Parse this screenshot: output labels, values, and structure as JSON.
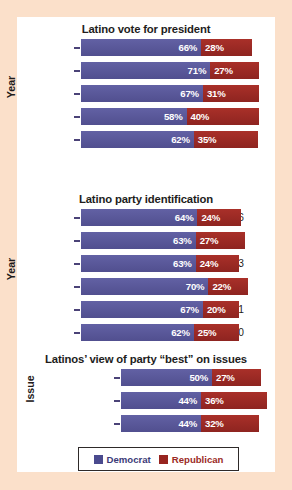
{
  "colors": {
    "outer_background": "#fbe0ca",
    "panel_background": "#ffffff",
    "democrat": "#59589a",
    "republican": "#9f2b25",
    "title_text": "#221d1c",
    "label_text": "#1f1b1a",
    "tick": "#4a4277",
    "legend_border": "#2e2a29",
    "legend_democrat_text": "#3c3a78",
    "legend_republican_text": "#9b2a24"
  },
  "legend": {
    "democrat_label": "Democrat",
    "republican_label": "Republican",
    "democrat_swatch": "democrat-color-swatch",
    "republican_swatch": "republican-color-swatch"
  },
  "chart_data": [
    {
      "type": "bar",
      "orientation": "horizontal",
      "stacked": true,
      "title": "Latino vote for president",
      "xlabel": "",
      "ylabel": "Year",
      "categories": [
        "2016",
        "2012",
        "2008",
        "2004",
        "2000"
      ],
      "series": [
        {
          "name": "Democrat",
          "values": [
            66,
            71,
            67,
            58,
            62
          ],
          "labels": [
            "66%",
            "71%",
            "67%",
            "58%",
            "62%"
          ]
        },
        {
          "name": "Republican",
          "values": [
            28,
            27,
            31,
            40,
            35
          ],
          "labels": [
            "28%",
            "27%",
            "31%",
            "40%",
            "35%"
          ]
        }
      ],
      "totals": [
        94,
        98,
        98,
        98,
        97
      ],
      "units": "percent",
      "grid": false
    },
    {
      "type": "bar",
      "orientation": "horizontal",
      "stacked": true,
      "title": "Latino party identification",
      "xlabel": "",
      "ylabel": "Year",
      "categories": [
        "2016",
        "2014",
        "2013",
        "2012",
        "2011",
        "2010"
      ],
      "series": [
        {
          "name": "Democrat",
          "values": [
            64,
            63,
            63,
            70,
            67,
            62
          ],
          "labels": [
            "64%",
            "63%",
            "63%",
            "70%",
            "67%",
            "62%"
          ]
        },
        {
          "name": "Republican",
          "values": [
            24,
            27,
            24,
            22,
            20,
            25
          ],
          "labels": [
            "24%",
            "27%",
            "24%",
            "22%",
            "20%",
            "25%"
          ]
        }
      ],
      "totals": [
        88,
        90,
        87,
        92,
        87,
        87
      ],
      "units": "percent",
      "grid": false
    },
    {
      "type": "bar",
      "orientation": "horizontal",
      "stacked": true,
      "title": "Latinos’ view of party “best” on issues",
      "xlabel": "",
      "ylabel": "Issue",
      "categories": [
        "Immigration",
        "Economy",
        "Foreign policy"
      ],
      "series": [
        {
          "name": "Democrat",
          "values": [
            50,
            44,
            44
          ],
          "labels": [
            "50%",
            "44%",
            "44%"
          ]
        },
        {
          "name": "Republican",
          "values": [
            27,
            36,
            32
          ],
          "labels": [
            "27%",
            "36%",
            "32%"
          ]
        }
      ],
      "totals": [
        77,
        80,
        76
      ],
      "units": "percent",
      "grid": false
    }
  ]
}
